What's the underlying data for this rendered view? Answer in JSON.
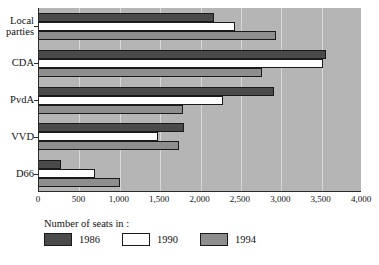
{
  "chart_data": {
    "type": "bar",
    "orientation": "horizontal",
    "title": "",
    "subtitle": "",
    "xlabel": "",
    "ylabel": "",
    "legend_title": "Number of seats in :",
    "legend_position": "bottom-left",
    "grid": true,
    "xlim": [
      0,
      4000
    ],
    "xticks": [
      0,
      500,
      1000,
      1500,
      2000,
      2500,
      3000,
      3500,
      4000
    ],
    "xtick_labels": [
      "0",
      "500",
      "1,000",
      "1,500",
      "2,000",
      "2,500",
      "3,000",
      "3,500",
      "4,000"
    ],
    "categories": [
      "Local parties",
      "CDA",
      "PvdA",
      "VVD",
      "D66"
    ],
    "category_labels_wrapped": [
      [
        "Local",
        "parties"
      ],
      [
        "CDA"
      ],
      [
        "PvdA"
      ],
      [
        "VVD"
      ],
      [
        "D66"
      ]
    ],
    "series": [
      {
        "name": "1986",
        "color": "#4a4a4a",
        "values": [
          2170,
          3560,
          2910,
          1800,
          270
        ]
      },
      {
        "name": "1990",
        "color": "#ffffff",
        "values": [
          2430,
          3520,
          2280,
          1470,
          690
        ]
      },
      {
        "name": "1994",
        "color": "#8e8e8e",
        "values": [
          2930,
          2760,
          1780,
          1730,
          1000
        ]
      }
    ]
  },
  "legend": {
    "title": "Number of seats in :",
    "items": [
      {
        "label": "1986",
        "swatch": "s1986"
      },
      {
        "label": "1990",
        "swatch": "s1990"
      },
      {
        "label": "1994",
        "swatch": "s1994"
      }
    ]
  },
  "colors": {
    "plot_background": "#b5b5b5",
    "gridline": "#d9d9d9",
    "axis": "#2b2b2b",
    "series_1986": "#4a4a4a",
    "series_1990": "#ffffff",
    "series_1994": "#8e8e8e",
    "page_background": "#ffffff",
    "text": "#111111"
  }
}
